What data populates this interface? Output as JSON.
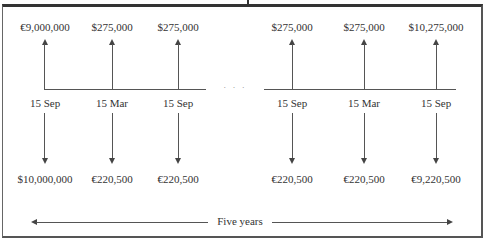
{
  "diagram": {
    "inflows": [
      {
        "amount": "€9,000,000",
        "date": "15 Sep"
      },
      {
        "amount": "$275,000",
        "date": "15 Mar"
      },
      {
        "amount": "$275,000",
        "date": "15 Sep"
      },
      {
        "amount": "$275,000",
        "date": "15 Sep"
      },
      {
        "amount": "$275,000",
        "date": "15 Mar"
      },
      {
        "amount": "$10,275,000",
        "date": "15 Sep"
      }
    ],
    "outflows": [
      {
        "amount": "$10,000,000"
      },
      {
        "amount": "€220,500"
      },
      {
        "amount": "€220,500"
      },
      {
        "amount": "€220,500"
      },
      {
        "amount": "€220,500"
      },
      {
        "amount": "€9,220,500"
      }
    ],
    "ellipsis": "· · ·",
    "duration_label": "Five years"
  }
}
